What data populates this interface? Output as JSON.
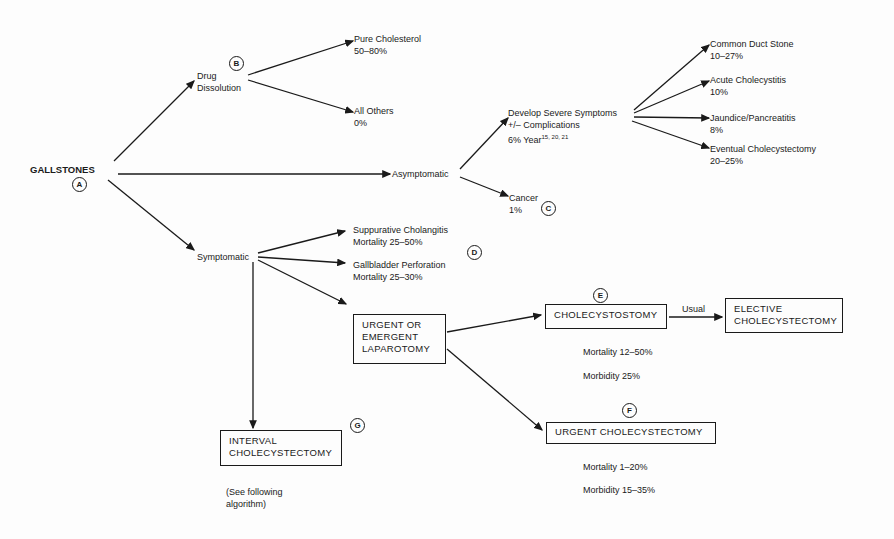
{
  "diagram": {
    "root": {
      "label": "GALLSTONES",
      "marker": "A"
    },
    "drug_dissolution": {
      "label_line1": "Drug",
      "label_line2": "Dissolution",
      "marker": "B"
    },
    "pure_cholesterol": {
      "label": "Pure Cholesterol",
      "value": "50–80%"
    },
    "all_others": {
      "label": "All Others",
      "value": "0%"
    },
    "asymptomatic": {
      "label": "Asymptomatic"
    },
    "severe_symptoms": {
      "line1": "Develop Severe Symptoms",
      "line2": "+/– Complications",
      "line3": "6% Year",
      "refs": "15, 20, 21"
    },
    "cancer": {
      "label": "Cancer",
      "value": "1%",
      "marker": "C"
    },
    "outcomes": [
      {
        "label": "Common Duct Stone",
        "value": "10–27%"
      },
      {
        "label": "Acute Cholecystitis",
        "value": "10%"
      },
      {
        "label": "Jaundice/Pancreatitis",
        "value": "8%"
      },
      {
        "label": "Eventual Cholecystectomy",
        "value": "20–25%"
      }
    ],
    "symptomatic": {
      "label": "Symptomatic",
      "marker": "D"
    },
    "suppurative": {
      "label": "Suppurative Cholangitis",
      "value": "Mortality 25–50%"
    },
    "perforation": {
      "label": "Gallbladder Perforation",
      "value": "Mortality 25–30%"
    },
    "laparotomy": {
      "line1": "URGENT OR",
      "line2": "EMERGENT",
      "line3": "LAPAROTOMY"
    },
    "cholecystostomy": {
      "label": "CHOLECYSTOSTOMY",
      "marker": "E",
      "mortality": "Mortality 12–50%",
      "morbidity": "Morbidity 25%"
    },
    "usual": {
      "label": "Usual"
    },
    "elective": {
      "line1": "ELECTIVE",
      "line2": "CHOLECYSTECTOMY"
    },
    "urgent_chole": {
      "label": "URGENT CHOLECYSTECTOMY",
      "marker": "F",
      "mortality": "Mortality 1–20%",
      "morbidity": "Morbidity 15–35%"
    },
    "interval": {
      "line1": "INTERVAL",
      "line2": "CHOLECYSTECTOMY",
      "marker": "G",
      "note_line1": "(See following",
      "note_line2": "algorithm)"
    }
  }
}
